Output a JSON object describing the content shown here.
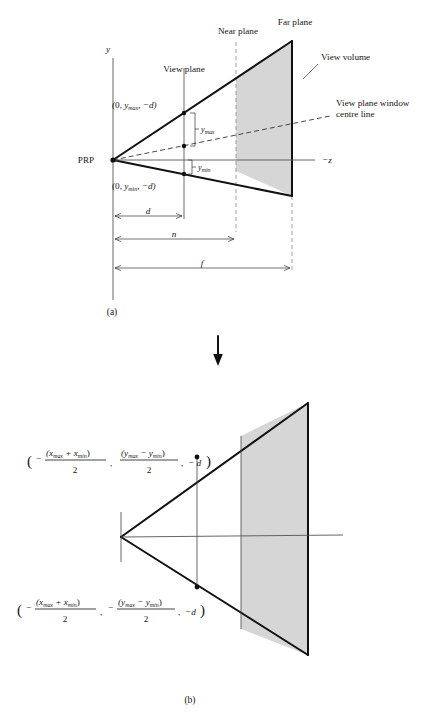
{
  "figure": {
    "panel_a": {
      "caption": "(a)",
      "labels": {
        "y_axis": "y",
        "prp": "PRP",
        "view_plane": "View plane",
        "near_plane": "Near plane",
        "far_plane": "Far plane",
        "view_volume": "View volume",
        "centre_line_1": "View plane window",
        "centre_line_2": "centre line",
        "neg_z": "−z",
        "y_max": "y",
        "y_max_sub": "max",
        "y_min": "y",
        "y_min_sub": "min"
      },
      "point_top": {
        "open": "(0, ",
        "var": "y",
        "sub": "max",
        "tail": ", −d)"
      },
      "point_bottom": {
        "open": "(0, ",
        "var": "y",
        "sub": "min",
        "tail": ", −d)"
      },
      "dimensions": [
        {
          "name": "d",
          "label": "d"
        },
        {
          "name": "n",
          "label": "n"
        },
        {
          "name": "f",
          "label": "f"
        }
      ]
    },
    "arrow": {
      "name": "down-arrow",
      "glyph": "↓"
    },
    "panel_b": {
      "caption": "(b)",
      "formula_top": {
        "open_paren": "(",
        "minus1": "−",
        "num1": "(x",
        "num1_sub_a": "max",
        "num1_plus": " + x",
        "num1_sub_b": "min",
        "num1_close": ")",
        "den1": "2",
        "comma1": ",",
        "num2": "(y",
        "num2_sub_a": "max",
        "num2_minus": " − y",
        "num2_sub_b": "min",
        "num2_close": ")",
        "den2": "2",
        "comma2": ",",
        "minus2": "− d",
        "close_paren": ")"
      },
      "formula_bottom": {
        "open_paren": "(",
        "minus1": "−",
        "num1": "(x",
        "num1_sub_a": "max",
        "num1_plus": " + x",
        "num1_sub_b": "min",
        "num1_close": ")",
        "den1": "2",
        "comma1": ",",
        "ysign": "−",
        "num2": "(y",
        "num2_sub_a": "max",
        "num2_minus": " − y",
        "num2_sub_b": "min",
        "num2_close": ")",
        "den2": "2",
        "comma2": ",",
        "minus2": "−d",
        "close_paren": ")"
      }
    },
    "colors": {
      "view_volume_fill": "#d6d6d6",
      "line": "#111111",
      "guide": "#8a8a8a"
    }
  }
}
